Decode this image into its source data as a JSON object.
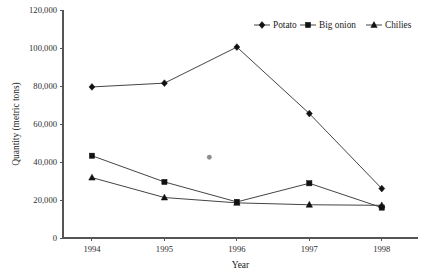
{
  "chart_data": {
    "type": "line",
    "title": "",
    "xlabel": "Year",
    "ylabel": "Quantity (metric tons)",
    "categories": [
      "1994",
      "1995",
      "1996",
      "1997",
      "1998"
    ],
    "x": [
      1994,
      1995,
      1996,
      1997,
      1998
    ],
    "xlim": [
      1993.6,
      1998.5
    ],
    "ylim": [
      0,
      120000
    ],
    "ytick_labels": [
      "0",
      "20,000",
      "40,000",
      "60,000",
      "80,000",
      "100,000",
      "120,000"
    ],
    "ytick_values": [
      0,
      20000,
      40000,
      60000,
      80000,
      100000,
      120000
    ],
    "xtick_labels": [
      "1994",
      "1995",
      "1996",
      "1997",
      "1998"
    ],
    "grid": false,
    "legend_position": "top-right",
    "series": [
      {
        "name": "Potato",
        "marker": "diamond",
        "values": [
          79500,
          81500,
          100500,
          65500,
          26000
        ]
      },
      {
        "name": "Big onion",
        "marker": "square",
        "values": [
          43300,
          29500,
          19000,
          28800,
          16000
        ]
      },
      {
        "name": "Chilies",
        "marker": "triangle",
        "values": [
          31800,
          21300,
          18500,
          17500,
          17200
        ]
      }
    ],
    "annotations": [
      {
        "name": "stray-mark",
        "x": 1995.62,
        "y": 42500,
        "color": "#8e8e8e"
      }
    ],
    "colors": {
      "line": "#3a3a3a",
      "marker": "#111111",
      "axis": "#555555",
      "text": "#1a1a1a"
    }
  },
  "legend": {
    "items": [
      {
        "label": "Potato"
      },
      {
        "label": "Big onion"
      },
      {
        "label": "Chilies"
      }
    ]
  }
}
